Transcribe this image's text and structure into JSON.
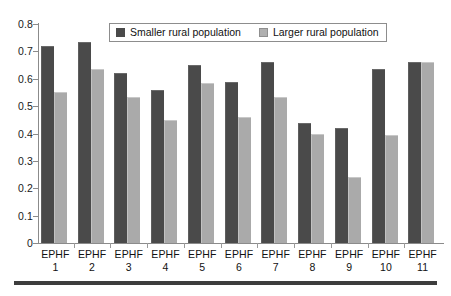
{
  "chart_data": {
    "type": "bar",
    "title": "",
    "subtitle": "",
    "xlabel": "",
    "ylabel": "",
    "ylim": [
      0,
      0.8
    ],
    "ytick_labels": [
      "0.8",
      "0.7",
      "0.6",
      "0.5",
      "0.4",
      "0.3",
      "0.2",
      "0.1",
      "0"
    ],
    "ytick_values": [
      0.8,
      0.7,
      0.6,
      0.5,
      0.4,
      0.3,
      0.2,
      0.1,
      0
    ],
    "grid": false,
    "legend_position": "top-center",
    "categories": [
      "EPHF 1",
      "EPHF 2",
      "EPHF 3",
      "EPHF 4",
      "EPHF 5",
      "EPHF 6",
      "EPHF 7",
      "EPHF 8",
      "EPHF 9",
      "EPHF 10",
      "EPHF 11"
    ],
    "category_lines": [
      [
        "EPHF",
        "1"
      ],
      [
        "EPHF",
        "2"
      ],
      [
        "EPHF",
        "3"
      ],
      [
        "EPHF",
        "4"
      ],
      [
        "EPHF",
        "5"
      ],
      [
        "EPHF",
        "6"
      ],
      [
        "EPHF",
        "7"
      ],
      [
        "EPHF",
        "8"
      ],
      [
        "EPHF",
        "9"
      ],
      [
        "EPHF",
        "10"
      ],
      [
        "EPHF",
        "11"
      ]
    ],
    "series": [
      {
        "name": "Smaller rural population",
        "color": "#4a4a4a",
        "values": [
          0.72,
          0.735,
          0.62,
          0.56,
          0.65,
          0.59,
          0.66,
          0.44,
          0.42,
          0.635,
          0.66
        ]
      },
      {
        "name": "Larger rural population",
        "color": "#aaaaaa",
        "values": [
          0.55,
          0.635,
          0.535,
          0.45,
          0.585,
          0.46,
          0.535,
          0.4,
          0.24,
          0.395,
          0.66
        ]
      }
    ]
  },
  "legend": {
    "entries": [
      {
        "label": "Smaller rural population",
        "swatch": "dark"
      },
      {
        "label": "Larger rural population",
        "swatch": "light"
      }
    ]
  },
  "colors": {
    "series_dark": "#4a4a4a",
    "series_light": "#aaaaaa",
    "axis": "#8b8b8b",
    "text": "#111111",
    "rule": "#3d3d3d",
    "background": "#ffffff"
  }
}
